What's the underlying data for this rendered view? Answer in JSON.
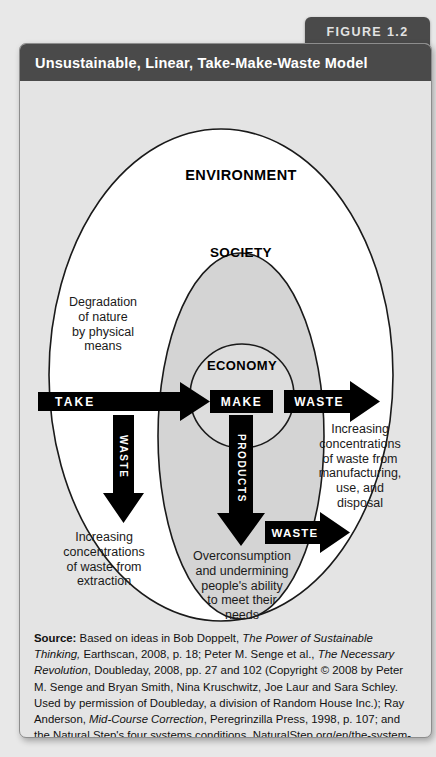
{
  "figure": {
    "tab_label": "FIGURE 1.2",
    "title": "Unsustainable, Linear, Take-Make-Waste Model"
  },
  "colors": {
    "header_bg": "#4a4a4a",
    "tab_bg": "#4a4a4a",
    "panel_bg": "#e4e4e4",
    "environment_fill": "#ffffff",
    "society_fill": "#d5d5d5",
    "economy_fill": "#dcdcdc",
    "arrow_fill": "#000000",
    "stroke": "#1a1a1a",
    "title_text": "#ffffff"
  },
  "diagram": {
    "rings": [
      {
        "id": "environment",
        "label": "ENVIRONMENT"
      },
      {
        "id": "society",
        "label": "SOCIETY"
      },
      {
        "id": "economy",
        "label": "ECONOMY"
      }
    ],
    "flows": [
      {
        "id": "take",
        "label": "TAKE",
        "shape": "arrow-right",
        "orientation": "horizontal"
      },
      {
        "id": "make",
        "label": "MAKE",
        "shape": "box",
        "orientation": "horizontal"
      },
      {
        "id": "waste-right-upper",
        "label": "WASTE",
        "shape": "arrow-right",
        "orientation": "horizontal"
      },
      {
        "id": "waste-right-lower",
        "label": "WASTE",
        "shape": "arrow-right",
        "orientation": "horizontal"
      },
      {
        "id": "waste-down",
        "label": "WASTE",
        "shape": "arrow-down",
        "orientation": "vertical"
      },
      {
        "id": "products",
        "label": "PRODUCTS",
        "shape": "arrow-down",
        "orientation": "vertical"
      }
    ],
    "annotations": [
      {
        "id": "degradation",
        "text": "Degradation\nof nature\nby physical\nmeans"
      },
      {
        "id": "extraction",
        "text": "Increasing\nconcentrations\nof waste from\nextraction"
      },
      {
        "id": "manufacturing",
        "text": "Increasing\nconcentrations\nof waste from\nmanufacturing,\nuse, and\ndisposal"
      },
      {
        "id": "overconsumption",
        "text": "Overconsumption\nand undermining\npeople's ability\nto meet their\nneeds"
      }
    ]
  },
  "source": {
    "label": "Source:",
    "p1": " Based on ideas in Bob Doppelt, ",
    "i1": "The Power of Sustainable Thinking,",
    "p2": " Earthscan, 2008, p. 18; Peter M. Senge et al., ",
    "i2": "The Necessary Revolution",
    "p3": ", Doubleday, 2008, pp. 27 and 102 (Copyright © 2008 by Peter M. Senge and Bryan Smith, Nina Kruschwitz, Joe Laur and Sara Schley. Used by permission of Doubleday, a division of Random House Inc.); Ray Anderson, ",
    "i3": "Mid-Course Correction",
    "p4": ", Peregrinzilla Press, 1998, p. 107; and the Natural Step's four systems conditions, NaturalStep.org/en/the-system-conditions."
  }
}
